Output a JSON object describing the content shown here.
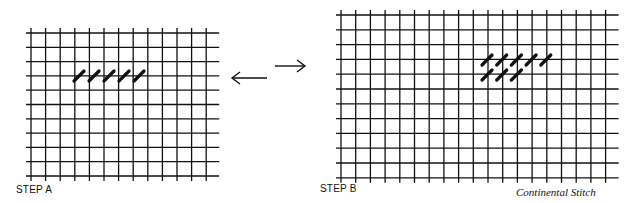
{
  "figure": {
    "title": "Continental Stitch",
    "steps": [
      {
        "label": "STEP A",
        "stitches_row1": 5,
        "stitches_row2": 0
      },
      {
        "label": "STEP B",
        "stitches_row1": 5,
        "stitches_row2": 3
      }
    ],
    "arrows": {
      "left": "←",
      "right": "→"
    },
    "line_color": "#111111",
    "background": "#ffffff"
  }
}
